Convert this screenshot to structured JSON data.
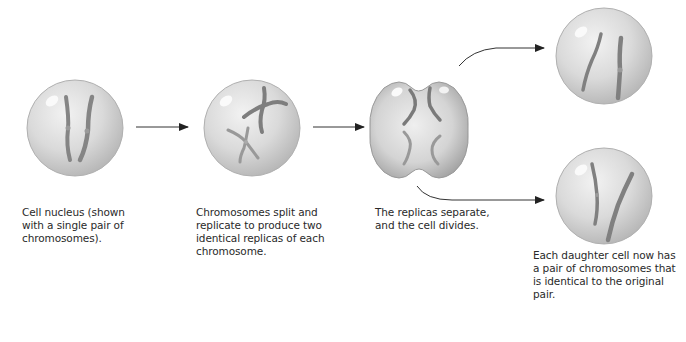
{
  "steps": [
    {
      "id": "nucleus",
      "caption_lines": [
        "Cell nucleus (shown",
        "with a single pair of",
        "chromosomes)."
      ]
    },
    {
      "id": "replicate",
      "caption_lines": [
        "Chromosomes split and",
        "replicate to produce two",
        "identical replicas of each",
        "chromosome."
      ]
    },
    {
      "id": "separate",
      "caption_lines": [
        "The replicas separate,",
        "and the cell divides."
      ]
    },
    {
      "id": "daughters",
      "caption_lines": [
        "Each daughter cell now has",
        "a pair of chromosomes that",
        "is identical to the original",
        "pair."
      ]
    }
  ],
  "colors": {
    "cell_fill": "#d6d6d6",
    "cell_edge": "#a9a9a9",
    "chromosome": "#8a8a8a",
    "arrow": "#222222",
    "text": "#2a2a2a"
  }
}
